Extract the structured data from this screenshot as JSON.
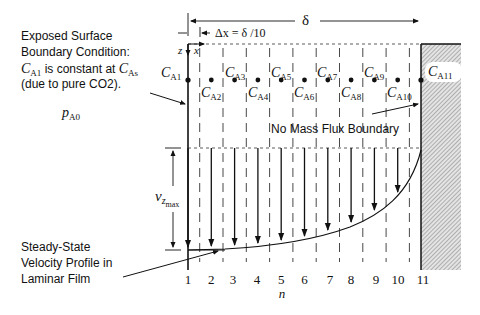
{
  "annotations": {
    "boundary_title_line1": "Exposed Surface",
    "boundary_title_line2": "Boundary Condition:",
    "boundary_line3_pre": "C",
    "boundary_line3_sub": "A1",
    "boundary_line3_mid": " is constant at ",
    "boundary_line3_c": "C",
    "boundary_line3_sub2": "As",
    "boundary_line4": "(due to pure CO2).",
    "pa0_main": "p",
    "pa0_sub": "A0",
    "no_flux": "No Mass Flux Boundary",
    "velocity_line1": "Steady-State",
    "velocity_line2": "Velocity Profile in",
    "velocity_line3": "Laminar Film",
    "vz_main": "v",
    "vz_sub": "z",
    "vz_subsub": "max"
  },
  "dimensions": {
    "delta": "δ",
    "dx": "Δx = δ /10",
    "z_axis": "z",
    "x_axis": "x",
    "n_axis": "n"
  },
  "nodes": {
    "labels": [
      "1",
      "2",
      "3",
      "4",
      "5",
      "6",
      "7",
      "8",
      "9",
      "10",
      "11"
    ],
    "concentrations": [
      {
        "c": "C",
        "sub": "A1"
      },
      {
        "c": "C",
        "sub": "A2"
      },
      {
        "c": "C",
        "sub": "A3"
      },
      {
        "c": "C",
        "sub": "A4"
      },
      {
        "c": "C",
        "sub": "A5"
      },
      {
        "c": "C",
        "sub": "A6"
      },
      {
        "c": "C",
        "sub": "A7"
      },
      {
        "c": "C",
        "sub": "A8"
      },
      {
        "c": "C",
        "sub": "A9"
      },
      {
        "c": "C",
        "sub": "A10"
      },
      {
        "c": "C",
        "sub": "A11"
      }
    ]
  },
  "colors": {
    "line": "#111111",
    "wall_fill": "#cfcfcf",
    "background": "#ffffff"
  }
}
